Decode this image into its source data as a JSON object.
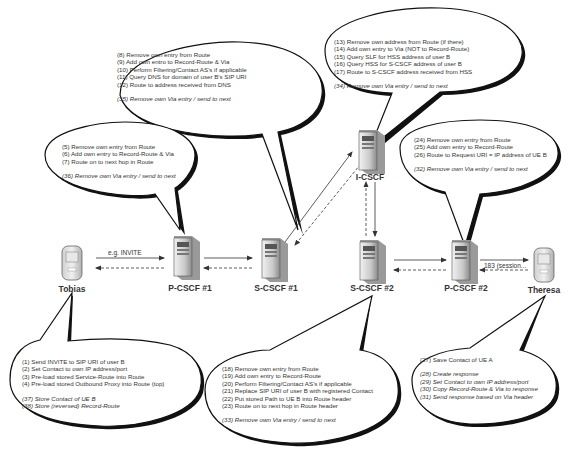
{
  "diagram": {
    "nodes": [
      {
        "id": "tobias",
        "label": "Tobias",
        "kind": "phone"
      },
      {
        "id": "pcscf1",
        "label": "P-CSCF #1",
        "kind": "server"
      },
      {
        "id": "scscf1",
        "label": "S-CSCF #1",
        "kind": "server"
      },
      {
        "id": "icscf",
        "label": "I-CSCF",
        "kind": "server"
      },
      {
        "id": "scscf2",
        "label": "S-CSCF #2",
        "kind": "server"
      },
      {
        "id": "pcscf2",
        "label": "P-CSCF #2",
        "kind": "server"
      },
      {
        "id": "theresa",
        "label": "Theresa",
        "kind": "phone"
      }
    ],
    "messages": {
      "request": "e.g. INVITE",
      "response": "183 (session..."
    },
    "bubbles": {
      "pcscf1": {
        "steps": [
          "(5)  Remove own entry from Route",
          "(6)  Add own entry to Record-Route & Via",
          "(7)  Route on to next hop in Route"
        ],
        "response_steps": [
          "(36)  Remove own Via entry / send to next"
        ]
      },
      "scscf1": {
        "steps": [
          "(8)  Remove own entry from Route",
          "(9)  Add own entro to Record-Route & Via",
          "(10)  Perform Filtering/Contact AS's if applicable",
          "(11)  Query DNS for domain of user B's SIP URI",
          "(12)  Route to address received from DNS"
        ],
        "response_steps": [
          "(35)  Remove own Via entry / send to next"
        ]
      },
      "icscf": {
        "steps": [
          "(13)  Remove own address from Route (if there)",
          "(14)  Add own entry to Via (NOT to Record-Route)",
          "(15)  Query SLF for HSS address of user B",
          "(16)  Query HSS for S-CSCF address of user B",
          "(17)  Route to S-CSCF address received from HSS"
        ],
        "response_steps": [
          "(34)  Remove own Via entry / send to next"
        ]
      },
      "pcscf2": {
        "steps": [
          "(24)  Remove own entry from Route",
          "(25)  Add own entry to Record-Route",
          "(26)  Route to Request URI = IP address of UE B"
        ],
        "response_steps": [
          "(32)  Remove own Via entry / send to next"
        ]
      },
      "tobias": {
        "steps": [
          "(1)  Send INVITE to SIP URI of user B",
          "(2)  Set Contact to own IP address/port",
          "(3)  Pre-load stored Service-Route into Route",
          "(4)  Pre-load stored Outbound Proxy into Route (top)"
        ],
        "response_steps": [
          "(37)  Store Contact of UE B",
          "(38)  Store (reversed) Record-Route"
        ]
      },
      "scscf2": {
        "steps": [
          "(18)  Remove own entry from Route",
          "(19)  Add own entry to Record-Route",
          "(20)  Perform Filtering/Contact AS's if applicable",
          "(21)  Replace SIP URI of user B with registered Contact",
          "(22)  Put stored Path to UE B into Route header",
          "(23)  Route on to next hop in Route header"
        ],
        "response_steps": [
          "(33)  Remove own Via entry / send to next"
        ]
      },
      "theresa": {
        "steps": [
          "(27)  Save Contact of UE A"
        ],
        "response_steps": [
          "(28)  Create response",
          "(29)  Set Contact to own IP address/port",
          "(30)  Copy Record-Route & Via to response",
          "(31)  Send response based on Via header"
        ]
      }
    }
  }
}
